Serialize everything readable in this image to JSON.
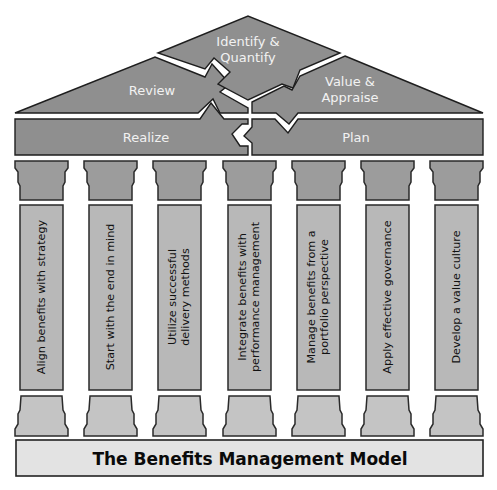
{
  "title": "The Benefits Management Model",
  "roof": {
    "identify": {
      "line1": "Identify &",
      "line2": "Quantify"
    },
    "review": {
      "label": "Review"
    },
    "value": {
      "line1": "Value &",
      "line2": "Appraise"
    },
    "realize": {
      "label": "Realize"
    },
    "plan": {
      "label": "Plan"
    }
  },
  "pillars": [
    {
      "line1": "Align benefits with strategy",
      "line2": ""
    },
    {
      "line1": "Start with the end in mind",
      "line2": ""
    },
    {
      "line1": "Utilize successful",
      "line2": "delivery methods"
    },
    {
      "line1": "Integrate benefits with",
      "line2": "performance management"
    },
    {
      "line1": "Manage benefits from a",
      "line2": "portfolio perspective"
    },
    {
      "line1": "Apply effective governance",
      "line2": ""
    },
    {
      "line1": "Develop a value culture",
      "line2": ""
    }
  ],
  "colors": {
    "roof_fill": "#8f8f8f",
    "capital_fill": "#9c9c9c",
    "shaft_fill": "#b8b8b8",
    "base_fill": "#c4c4c4",
    "plinth_fill": "#e3e3e3"
  }
}
